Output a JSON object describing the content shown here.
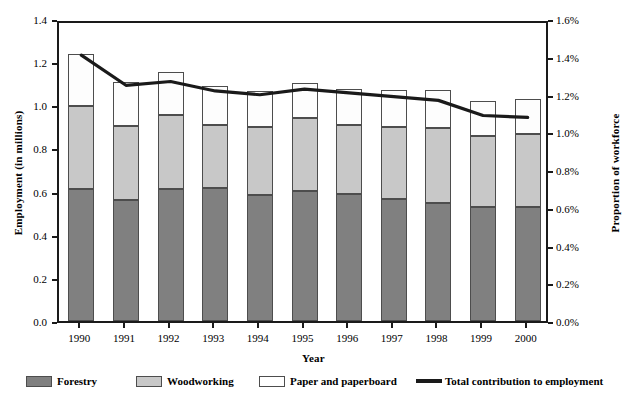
{
  "chart_data": {
    "type": "bar",
    "subtype": "stacked-bar-with-line",
    "title": "",
    "xlabel": "Year",
    "ylabel": "Employment (in millions)",
    "y2label": "Proportion of workforce",
    "categories": [
      "1990",
      "1991",
      "1992",
      "1993",
      "1994",
      "1995",
      "1996",
      "1997",
      "1998",
      "1999",
      "2000"
    ],
    "ylim": [
      0.0,
      1.4
    ],
    "y2lim": [
      0.0,
      1.6
    ],
    "ytick_labels": [
      "0.0",
      "0.2",
      "0.4",
      "0.6",
      "0.8",
      "1.0",
      "1.2",
      "1.4"
    ],
    "ytick_values": [
      0.0,
      0.2,
      0.4,
      0.6,
      0.8,
      1.0,
      1.2,
      1.4
    ],
    "y2tick_labels": [
      "0.0%",
      "0.2%",
      "0.4%",
      "0.6%",
      "0.8%",
      "1.0%",
      "1.2%",
      "1.4%",
      "1.6%"
    ],
    "y2tick_values": [
      0.0,
      0.2,
      0.4,
      0.6,
      0.8,
      1.0,
      1.2,
      1.4,
      1.6
    ],
    "grid": false,
    "legend_position": "bottom",
    "series": [
      {
        "name": "Forestry",
        "axis": "left",
        "kind": "bar-segment",
        "color": "#808080",
        "values": [
          0.61,
          0.56,
          0.61,
          0.615,
          0.585,
          0.605,
          0.59,
          0.565,
          0.545,
          0.53,
          0.53
        ]
      },
      {
        "name": "Woodworking",
        "axis": "left",
        "kind": "bar-segment",
        "color": "#c8c8c8",
        "values": [
          0.385,
          0.345,
          0.345,
          0.295,
          0.315,
          0.335,
          0.32,
          0.335,
          0.35,
          0.33,
          0.335
        ]
      },
      {
        "name": "Paper and paperboard",
        "axis": "left",
        "kind": "bar-segment",
        "color": "#fdfdfd",
        "values": [
          0.245,
          0.205,
          0.2,
          0.18,
          0.165,
          0.165,
          0.165,
          0.17,
          0.175,
          0.16,
          0.165
        ]
      },
      {
        "name": "Total contribution to employment",
        "axis": "right",
        "kind": "line",
        "color": "#1a1a1a",
        "values": [
          1.43,
          1.27,
          1.29,
          1.24,
          1.22,
          1.25,
          1.23,
          1.21,
          1.19,
          1.11,
          1.1
        ]
      }
    ],
    "bar_totals": [
      1.24,
      1.11,
      1.155,
      1.09,
      1.065,
      1.105,
      1.075,
      1.07,
      1.07,
      1.02,
      1.03
    ]
  },
  "legend": {
    "items": [
      {
        "label": "Forestry",
        "marker": "swatch-dark-gray"
      },
      {
        "label": "Woodworking",
        "marker": "swatch-light-gray"
      },
      {
        "label": "Paper and paperboard",
        "marker": "swatch-white"
      },
      {
        "label": "Total contribution to employment",
        "marker": "line-black"
      }
    ]
  }
}
